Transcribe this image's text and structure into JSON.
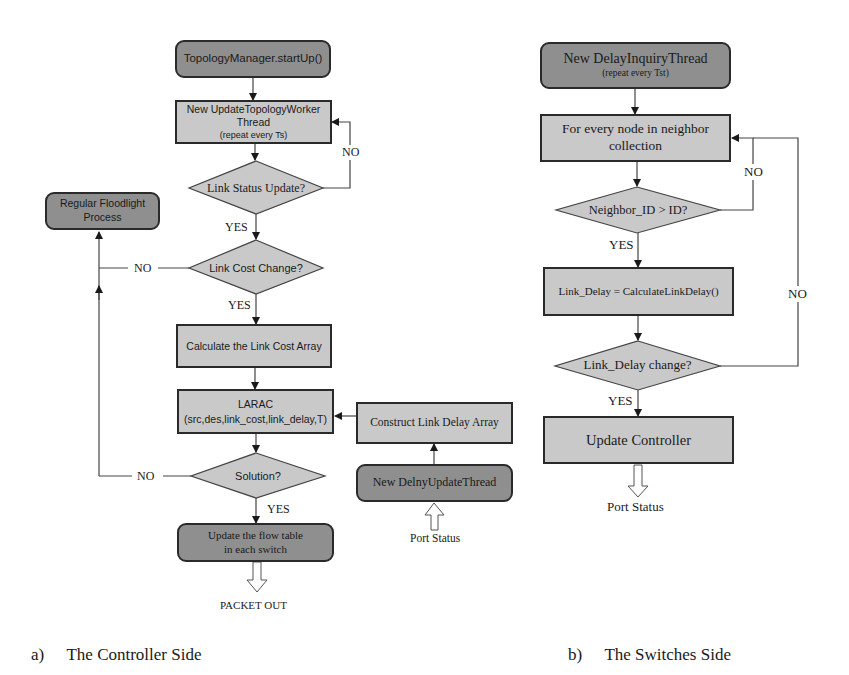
{
  "controller_side": {
    "caption_letter": "a)",
    "caption_text": "The Controller Side",
    "nodes": {
      "startup": "TopologyManager.startUp()",
      "worker_line1": "New UpdateTopologyWorker",
      "worker_line2": "Thread",
      "worker_line3": "(repeat every Ts)",
      "link_status": "Link Status Update?",
      "floodlight_line1": "Regular Floodlight",
      "floodlight_line2": "Process",
      "link_cost_change": "Link Cost Change?",
      "calc_cost": "Calculate the Link Cost Array",
      "larac_line1": "LARAC",
      "larac_line2": "(src,des,link_cost,link_delay,T)",
      "construct_delay": "Construct Link Delay Array",
      "solution": "Solution?",
      "delay_update_thread": "New DelnyUpdateThread",
      "port_status": "Port Status",
      "update_flow_line1": "Update the flow table",
      "update_flow_line2": "in each switch",
      "packet_out": "PACKET OUT"
    },
    "edge_labels": {
      "no_status": "NO",
      "yes_status": "YES",
      "no_cost": "NO",
      "yes_cost": "YES",
      "no_solution": "NO",
      "yes_solution": "YES"
    }
  },
  "switches_side": {
    "caption_letter": "b)",
    "caption_text": "The Switches Side",
    "nodes": {
      "inquiry_line1": "New DelayInquiryThread",
      "inquiry_line2": "(repeat every Tst)",
      "for_every_line1": "For every node in neighbor",
      "for_every_line2": "collection",
      "neighbor_check": "Neighbor_ID > ID?",
      "link_delay_calc": "Link_Delay = CalculateLinkDelay()",
      "link_delay_change": "Link_Delay change?",
      "update_controller": "Update Controller",
      "port_status": "Port Status"
    },
    "edge_labels": {
      "no_neighbor": "NO",
      "yes_neighbor": "YES",
      "no_delay": "NO",
      "yes_delay": "YES"
    }
  },
  "colors": {
    "dark_node": "#8f8f8f",
    "light_node": "#c9c9c9",
    "stroke": "#2a2a2a"
  }
}
